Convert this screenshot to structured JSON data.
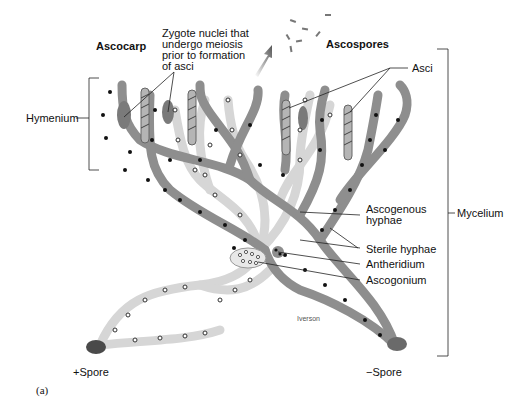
{
  "figure": {
    "panel_label": "(a)",
    "artist_signature": "Iverson"
  },
  "labels": {
    "ascocarp": "Ascocarp",
    "zygote_nuclei": [
      "Zygote nuclei that",
      "undergo meiosis",
      "prior to formation",
      "of asci"
    ],
    "ascospores": "Ascospores",
    "asci": "Asci",
    "hymenium": "Hymenium",
    "mycelium": "Mycelium",
    "ascogenous_hyphae": [
      "Ascogenous",
      "hyphae"
    ],
    "sterile_hyphae": "Sterile hyphae",
    "antheridium": "Antheridium",
    "ascogonium": "Ascogonium",
    "plus_spore": "+Spore",
    "minus_spore": "−Spore"
  },
  "colors": {
    "dark_hypha": "#8a8a8a",
    "light_hypha": "#d9d9d9",
    "spore": "#555555",
    "line": "#222222",
    "text": "#111111"
  }
}
